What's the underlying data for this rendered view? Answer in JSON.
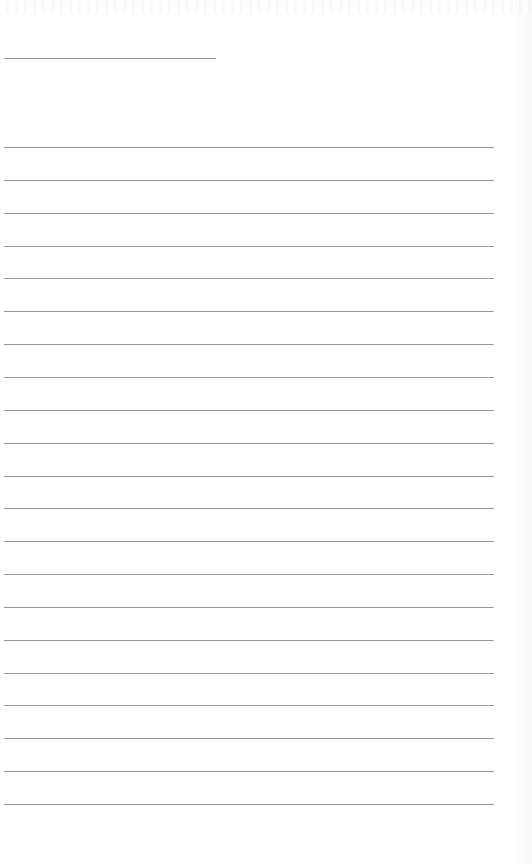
{
  "page": {
    "type": "lined-paper",
    "background_color": "#fefefe",
    "line_color": "#9a9a9a",
    "header_line": {
      "left": 4,
      "top": 58,
      "width": 212
    },
    "ruled_lines": {
      "count": 21,
      "first_top": 147,
      "spacing": 32.85,
      "left": 4,
      "width": 490
    },
    "text_content": []
  }
}
